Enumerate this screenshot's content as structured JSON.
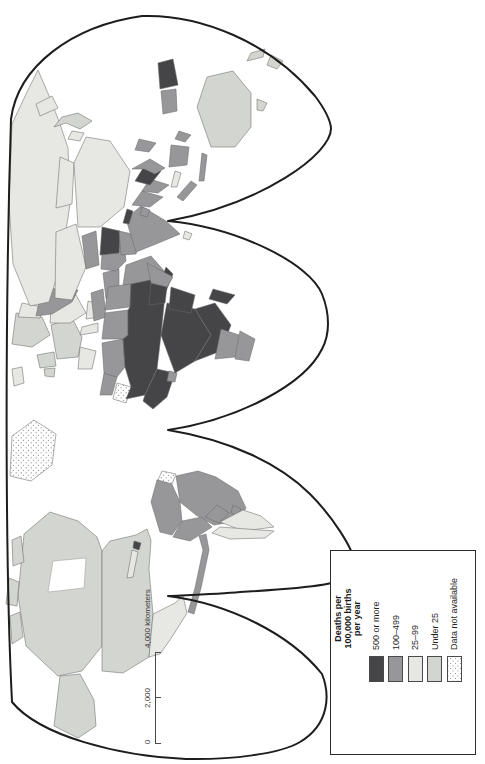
{
  "figure": {
    "type": "choropleth-world-map",
    "legend": {
      "title_lines": [
        "Deaths per",
        "100,000 births",
        "per year"
      ],
      "items": [
        {
          "key": "cat_500plus",
          "label": "500 or more",
          "color": "#454548"
        },
        {
          "key": "cat_100_499",
          "label": "100–499",
          "color": "#97979a"
        },
        {
          "key": "cat_25_99",
          "label": "25–99",
          "color": "#e7e7e4"
        },
        {
          "key": "cat_under25",
          "label": "Under 25",
          "color": "#d3d5d0"
        },
        {
          "key": "cat_nodata",
          "label": "Data not available",
          "color": "stipple"
        }
      ]
    },
    "scale_bar": {
      "labels": [
        "0",
        "2,000",
        "4,000 kilometers"
      ]
    },
    "map": {
      "ocean_color": "#ffffff",
      "outline_color": "#1d1d1d",
      "border_color": "#6a6a6a",
      "water_color": "#ffffff",
      "region_categories": {
        "alaska": "cat_under25",
        "canada": "cat_under25",
        "arctic-island-1": "cat_under25",
        "arctic-island-2": "cat_under25",
        "arctic-island-3": "cat_under25",
        "usa": "cat_under25",
        "uk": "cat_under25",
        "ireland": "cat_under25",
        "scandinavia": "cat_under25",
        "west-europe": "cat_under25",
        "japan": "cat_under25",
        "australia": "cat_under25",
        "tasmania": "cat_under25",
        "new-zealand-north": "cat_under25",
        "new-zealand-south": "cat_under25",
        "iceland": "cat_25_99",
        "finland": "cat_25_99",
        "iberia": "cat_25_99",
        "italy": "cat_25_99",
        "east-europe": "cat_25_99",
        "balkans": "cat_25_99",
        "russia": "cat_25_99",
        "kamchatka": "cat_25_99",
        "kazakhstan": "cat_25_99",
        "mongolia": "cat_25_99",
        "china": "cat_25_99",
        "korea": "cat_25_99",
        "mexico": "cat_25_99",
        "cuba": "cat_25_99",
        "argentina": "cat_25_99",
        "chile": "cat_25_99",
        "malaysia": "cat_25_99",
        "sri-lanka": "cat_25_99",
        "east-europe-belt": "cat_100_499",
        "central-america": "cat_100_499",
        "colombia-venezuela": "cat_100_499",
        "brazil": "cat_100_499",
        "peru": "cat_100_499",
        "bolivia": "cat_100_499",
        "paraguay": "cat_100_499",
        "morocco": "cat_100_499",
        "algeria": "cat_100_499",
        "libya": "cat_100_499",
        "egypt": "cat_100_499",
        "turkey": "cat_100_499",
        "iraq-syria": "cat_100_499",
        "iran": "cat_100_499",
        "saudi-arabia": "cat_100_499",
        "pakistan": "cat_100_499",
        "india": "cat_100_499",
        "bangladesh": "cat_100_499",
        "myanmar": "cat_100_499",
        "thailand": "cat_100_499",
        "vietnam": "cat_100_499",
        "sumatra": "cat_100_499",
        "java": "cat_100_499",
        "borneo": "cat_100_499",
        "sulawesi": "cat_100_499",
        "philippines": "cat_100_499",
        "west-papua": "cat_100_499",
        "somalia": "cat_100_499",
        "namibia-botswana": "cat_100_499",
        "south-africa": "cat_100_499",
        "ghana": "cat_100_499",
        "uzbekistan": "cat_100_499",
        "haiti": "cat_500plus",
        "sahel": "cat_500plus",
        "west-africa": "cat_500plus",
        "central-africa": "cat_500plus",
        "ethiopia": "cat_500plus",
        "kenya-tanzania": "cat_500plus",
        "angola-mozambique": "cat_500plus",
        "madagascar": "cat_500plus",
        "yemen": "cat_500plus",
        "afghanistan": "cat_500plus",
        "nepal": "cat_500plus",
        "laos-cambodia": "cat_500plus",
        "papua-new-guinea": "cat_500plus",
        "greenland": "cat_nodata",
        "western-sahara": "cat_nodata",
        "guyanas": "cat_nodata",
        "hudson-bay": "water"
      }
    }
  }
}
